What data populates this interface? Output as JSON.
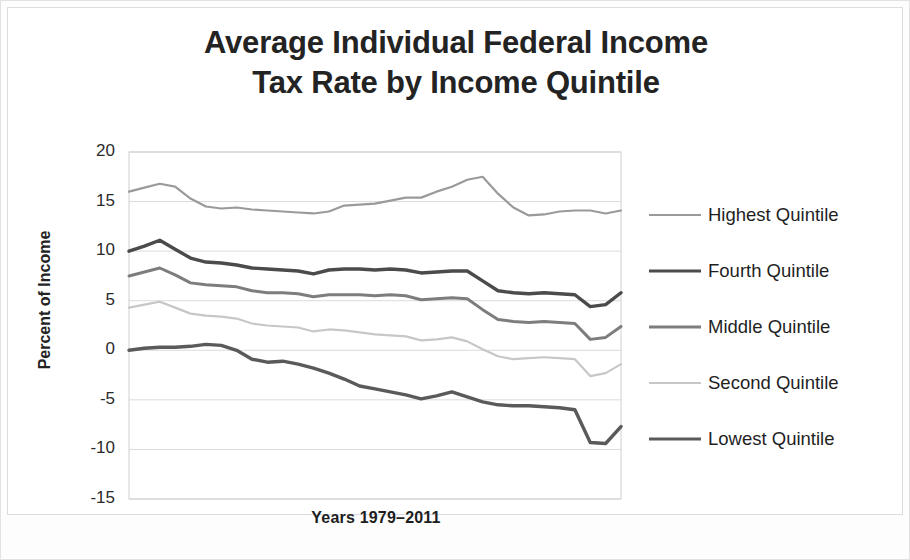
{
  "figure": {
    "title_line1": "Average Individual Federal Income",
    "title_line2": "Tax Rate by Income Quintile"
  },
  "chart_data": {
    "type": "line",
    "title": "Average Individual Federal Income Tax Rate by Income Quintile",
    "xlabel": "Years 1979–2011",
    "ylabel": "Percent of Income",
    "ylim": [
      -15,
      20
    ],
    "yticks": [
      20,
      15,
      10,
      5,
      0,
      -5,
      -10,
      -15
    ],
    "ytick_labels": [
      "20",
      "15",
      "10",
      "5",
      "0",
      "-5",
      "-10",
      "-15"
    ],
    "xlim": [
      1979,
      2011
    ],
    "grid": true,
    "legend_position": "right",
    "x": [
      1979,
      1980,
      1981,
      1982,
      1983,
      1984,
      1985,
      1986,
      1987,
      1988,
      1989,
      1990,
      1991,
      1992,
      1993,
      1994,
      1995,
      1996,
      1997,
      1998,
      1999,
      2000,
      2001,
      2002,
      2003,
      2004,
      2005,
      2006,
      2007,
      2008,
      2009,
      2010,
      2011
    ],
    "series": [
      {
        "name": "Highest Quintile",
        "color": "#9a9a9a",
        "width": 2.2,
        "values": [
          16.0,
          16.4,
          16.8,
          16.5,
          15.3,
          14.5,
          14.3,
          14.4,
          14.2,
          14.1,
          14.0,
          13.9,
          13.8,
          14.0,
          14.6,
          14.7,
          14.8,
          15.1,
          15.4,
          15.4,
          16.0,
          16.5,
          17.2,
          17.5,
          15.8,
          14.4,
          13.6,
          13.7,
          14.0,
          14.1,
          14.1,
          13.8,
          14.1
        ]
      },
      {
        "name": "Fourth Quintile",
        "color": "#4b4b4b",
        "width": 3.4,
        "values": [
          10.0,
          10.5,
          11.1,
          10.2,
          9.3,
          8.9,
          8.8,
          8.6,
          8.3,
          8.2,
          8.1,
          8.0,
          7.7,
          8.1,
          8.2,
          8.2,
          8.1,
          8.2,
          8.1,
          7.8,
          7.9,
          8.0,
          8.0,
          7.0,
          6.0,
          5.8,
          5.7,
          5.8,
          5.7,
          5.6,
          4.4,
          4.6,
          5.8
        ]
      },
      {
        "name": "Middle Quintile",
        "color": "#7d7d7d",
        "width": 3.0,
        "values": [
          7.5,
          7.9,
          8.3,
          7.6,
          6.8,
          6.6,
          6.5,
          6.4,
          6.0,
          5.8,
          5.8,
          5.7,
          5.4,
          5.6,
          5.6,
          5.6,
          5.5,
          5.6,
          5.5,
          5.1,
          5.2,
          5.3,
          5.2,
          4.1,
          3.1,
          2.9,
          2.8,
          2.9,
          2.8,
          2.7,
          1.1,
          1.3,
          2.4
        ]
      },
      {
        "name": "Second Quintile",
        "color": "#c7c7c7",
        "width": 2.2,
        "values": [
          4.3,
          4.6,
          4.9,
          4.3,
          3.7,
          3.5,
          3.4,
          3.2,
          2.7,
          2.5,
          2.4,
          2.3,
          1.9,
          2.1,
          2.0,
          1.8,
          1.6,
          1.5,
          1.4,
          1.0,
          1.1,
          1.3,
          0.9,
          0.1,
          -0.6,
          -0.9,
          -0.8,
          -0.7,
          -0.8,
          -0.9,
          -2.6,
          -2.3,
          -1.4
        ]
      },
      {
        "name": "Lowest Quintile",
        "color": "#5a5a5a",
        "width": 3.4,
        "values": [
          0.0,
          0.2,
          0.3,
          0.3,
          0.4,
          0.6,
          0.5,
          0.0,
          -0.9,
          -1.2,
          -1.1,
          -1.4,
          -1.8,
          -2.3,
          -2.9,
          -3.6,
          -3.9,
          -4.2,
          -4.5,
          -4.9,
          -4.6,
          -4.2,
          -4.7,
          -5.2,
          -5.5,
          -5.6,
          -5.6,
          -5.7,
          -5.8,
          -6.0,
          -9.3,
          -9.4,
          -7.7
        ]
      }
    ]
  },
  "axes": {
    "yticks": [
      "20",
      "15",
      "10",
      "5",
      "0",
      "-5",
      "-10",
      "-15"
    ],
    "ylabel": "Percent of Income",
    "xlabel": "Years 1979–2011"
  },
  "legend": {
    "items": [
      {
        "label": "Highest Quintile"
      },
      {
        "label": "Fourth Quintile"
      },
      {
        "label": "Middle Quintile"
      },
      {
        "label": "Second Quintile"
      },
      {
        "label": "Lowest Quintile"
      }
    ]
  }
}
